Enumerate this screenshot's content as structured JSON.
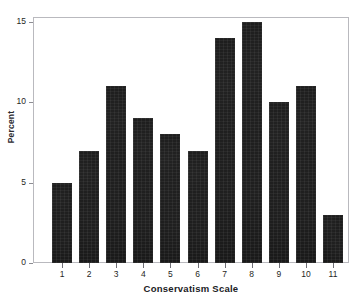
{
  "chart_data": {
    "type": "bar",
    "title": "",
    "xlabel": "Conservatism Scale",
    "ylabel": "Percent",
    "categories": [
      "1",
      "2",
      "3",
      "4",
      "5",
      "6",
      "7",
      "8",
      "9",
      "10",
      "11"
    ],
    "values": [
      5,
      7,
      11,
      9,
      8,
      7,
      14,
      15,
      10,
      11,
      3
    ],
    "ylim": [
      0,
      15
    ],
    "yticks": [
      0,
      5,
      10,
      15
    ],
    "yticklabels": [
      "0",
      "5",
      "10",
      "15"
    ],
    "grid": false,
    "legend": false,
    "legend_position": "none",
    "bar_color": "#171717",
    "frame_color": "#b9b9be",
    "background_color": "#ffffff"
  },
  "axes": {
    "y_label": "Percent",
    "x_label": "Conservatism Scale"
  }
}
